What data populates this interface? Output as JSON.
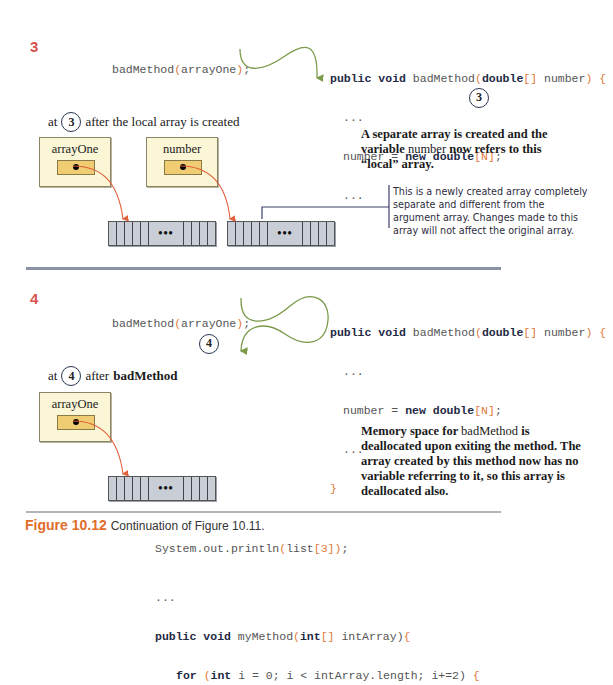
{
  "panel3": {
    "step": "3",
    "call_code": {
      "name": "badMethod",
      "open": "(",
      "arg": "arrayOne",
      "close": ")",
      "semi": ";"
    },
    "method_code": {
      "line1": {
        "kw1": "public",
        "kw2": "void",
        "name": "badMethod",
        "open": "(",
        "type": "double",
        "brackets": "[]",
        "param": "number",
        "close": ")",
        "brace": "{"
      },
      "line2": "...",
      "line3": {
        "lhs": "number",
        "eq": "=",
        "kw": "new",
        "type": "double",
        "open": "[",
        "size": "N",
        "close": "]",
        "semi": ";"
      },
      "line4": "...",
      "line5": "}"
    },
    "marker": "3",
    "state_label": {
      "prefix": "at",
      "marker": "3",
      "suffix": "after the local array is created"
    },
    "vars": [
      {
        "name": "arrayOne"
      },
      {
        "name": "number"
      }
    ],
    "array_ellipsis": "•••",
    "note_bold": {
      "part1": "A separate array is created and the variable",
      "code": "number",
      "part2": "now refers to this “local” array."
    },
    "callout": "This is a newly created array completely separate and different from the argument array. Changes made to this array will not affect the original array."
  },
  "panel4": {
    "step": "4",
    "call_code": {
      "name": "badMethod",
      "open": "(",
      "arg": "arrayOne",
      "close": ")",
      "semi": ";"
    },
    "marker": "4",
    "method_code": {
      "line1": {
        "kw1": "public",
        "kw2": "void",
        "name": "badMethod",
        "open": "(",
        "type": "double",
        "brackets": "[]",
        "param": "number",
        "close": ")",
        "brace": "{"
      },
      "line2": "...",
      "line3": {
        "lhs": "number",
        "eq": "=",
        "kw": "new",
        "type": "double",
        "open": "[",
        "size": "N",
        "close": "]",
        "semi": ";"
      },
      "line4": "...",
      "line5": "}"
    },
    "state_label": {
      "prefix": "at",
      "marker": "4",
      "suffix_bold": "after",
      "suffix_method": "badMethod"
    },
    "vars": [
      {
        "name": "arrayOne"
      }
    ],
    "array_ellipsis": "•••",
    "note": {
      "part1": "Memory space for",
      "code": "badMethod",
      "part2": "is deallocated upon exiting the method. The array created by this method now has no variable referring to it, so this array is deallocated also."
    }
  },
  "caption": {
    "figure": "Figure 10.12",
    "text": "Continuation of Figure 10.11."
  },
  "trailing_code": {
    "line1": {
      "text": "System.out.println",
      "open": "(",
      "arg": "list",
      "idx_open": "[",
      "idx": "3",
      "idx_close": "]",
      "close": ")",
      "semi": ";"
    },
    "line2": "...",
    "line3": {
      "kw1": "public",
      "kw2": "void",
      "name": "myMethod",
      "open": "(",
      "type": "int",
      "brackets": "[]",
      "param": "intArray",
      "close": ")",
      "brace": "{"
    },
    "line4": {
      "kw": "for",
      "open": "(",
      "type": "int",
      "rest": "i = 0; i < intArray.length; i+=2",
      "close": ")",
      "brace": "{"
    }
  },
  "colors": {
    "step": "#d9534f",
    "arrow_green": "#7a9a4a",
    "arrow_orange": "#e0603a",
    "callout_line": "#3a3f6a",
    "figure_label": "#e06d2a",
    "var_box": "#fbf6d6",
    "ref_slot": "#f0cc73",
    "array": "#c9ced6"
  }
}
